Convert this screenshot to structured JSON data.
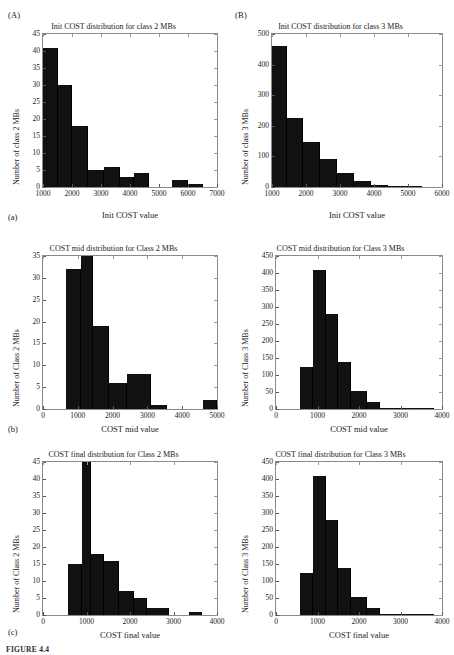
{
  "figure": {
    "caption": "FIGURE 4.4",
    "group_labels": [
      {
        "name": "group-label-A",
        "text": "(A)"
      },
      {
        "name": "group-label-B",
        "text": "(B)"
      }
    ],
    "sub_labels": [
      {
        "name": "sub-label-a",
        "text": "(a)"
      },
      {
        "name": "sub-label-b",
        "text": "(b)"
      },
      {
        "name": "sub-label-c",
        "text": "(c)"
      }
    ]
  },
  "chart_data": [
    {
      "id": "init-class2",
      "type": "bar",
      "title": "Init COST distribution for class 2 MBs",
      "xlabel": "Init COST value",
      "ylabel": "Number of class 2 MBs",
      "xlim": [
        1000,
        7000
      ],
      "ylim": [
        0,
        45
      ],
      "xticks": [
        1000,
        2000,
        3000,
        4000,
        5000,
        6000,
        7000
      ],
      "yticks": [
        0,
        5,
        10,
        15,
        20,
        25,
        30,
        35,
        40,
        45
      ],
      "bin_edges": [
        1000,
        1500,
        2000,
        2550,
        3100,
        3650,
        4150,
        4650,
        5450,
        6000,
        6500
      ],
      "values": [
        41,
        30,
        18,
        5,
        6,
        3,
        4,
        0,
        2,
        1
      ],
      "grid": false,
      "legend": "none"
    },
    {
      "id": "init-class3",
      "type": "bar",
      "title": "Init COST distribution for class 3 MBs",
      "xlabel": "Init COST value",
      "ylabel": "Number of class 3 MBs",
      "xlim": [
        1000,
        6000
      ],
      "ylim": [
        0,
        500
      ],
      "xticks": [
        1000,
        2000,
        3000,
        4000,
        5000,
        6000
      ],
      "yticks": [
        0,
        100,
        200,
        300,
        400,
        500
      ],
      "bin_edges": [
        1000,
        1450,
        1900,
        2400,
        2900,
        3400,
        3900,
        4400,
        5000,
        5400
      ],
      "values": [
        460,
        225,
        147,
        90,
        45,
        20,
        8,
        3,
        2
      ],
      "grid": false,
      "legend": "none"
    },
    {
      "id": "mid-class2",
      "type": "bar",
      "title": "COST mid distribution for Class 2 MBs",
      "xlabel": "COST mid value",
      "ylabel": "Number of Class 2 MBs",
      "xlim": [
        0,
        5000
      ],
      "ylim": [
        0,
        35
      ],
      "xticks": [
        0,
        1000,
        2000,
        3000,
        4000,
        5000
      ],
      "yticks": [
        0,
        5,
        10,
        15,
        20,
        25,
        30,
        35
      ],
      "bin_edges": [
        650,
        1100,
        1450,
        1900,
        2400,
        3100,
        3550,
        4600,
        5000
      ],
      "values": [
        32,
        35,
        19,
        6,
        8,
        1,
        0,
        2
      ],
      "grid": false,
      "legend": "none"
    },
    {
      "id": "mid-class3",
      "type": "bar",
      "title": "COST mid distribution for Class 3 MBs",
      "xlabel": "COST mid value",
      "ylabel": "Number of Class 3 MBs",
      "xlim": [
        0,
        4000
      ],
      "ylim": [
        0,
        450
      ],
      "xticks": [
        0,
        1000,
        2000,
        3000,
        4000
      ],
      "yticks": [
        0,
        50,
        100,
        150,
        200,
        250,
        300,
        350,
        400,
        450
      ],
      "bin_edges": [
        580,
        900,
        1200,
        1500,
        1800,
        2200,
        2500,
        3400,
        3800
      ],
      "values": [
        124,
        410,
        280,
        137,
        54,
        21,
        2,
        3
      ],
      "grid": false,
      "legend": "none"
    },
    {
      "id": "final-class2",
      "type": "bar",
      "title": "COST final distribution for Class 2 MBs",
      "xlabel": "COST final value",
      "ylabel": "Number of Class 2 MBs",
      "xlim": [
        0,
        4000
      ],
      "ylim": [
        0,
        45
      ],
      "xticks": [
        0,
        1000,
        2000,
        3000,
        4000
      ],
      "yticks": [
        0,
        5,
        10,
        15,
        20,
        25,
        30,
        35,
        40,
        45
      ],
      "bin_edges": [
        580,
        900,
        1100,
        1400,
        1750,
        2100,
        2400,
        2900,
        3350,
        3650
      ],
      "values": [
        15,
        45,
        18,
        16,
        7,
        5,
        2,
        0,
        1
      ],
      "grid": false,
      "legend": "none"
    },
    {
      "id": "final-class3",
      "type": "bar",
      "title": "COST final distribution for Class 3 MBs",
      "xlabel": "COST final value",
      "ylabel": "Number of Class 3 MBs",
      "xlim": [
        0,
        4000
      ],
      "ylim": [
        0,
        450
      ],
      "xticks": [
        0,
        1000,
        2000,
        3000,
        4000
      ],
      "yticks": [
        0,
        50,
        100,
        150,
        200,
        250,
        300,
        350,
        400,
        450
      ],
      "bin_edges": [
        580,
        900,
        1200,
        1500,
        1800,
        2200,
        2500,
        3400,
        3800
      ],
      "values": [
        124,
        410,
        280,
        137,
        54,
        21,
        2,
        3
      ],
      "grid": false,
      "legend": "none"
    }
  ],
  "colors": {
    "bar": "#111111",
    "axis": "#8a8a8a",
    "text": "#1a1a1a",
    "background": "#ffffff"
  }
}
